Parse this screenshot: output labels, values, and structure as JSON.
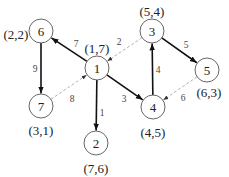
{
  "diagram": {
    "nodes": [
      {
        "id": "1",
        "label": "1",
        "coord": "(1,7)",
        "x": 97,
        "y": 68,
        "cx": 97,
        "cy": 48
      },
      {
        "id": "2",
        "label": "2",
        "coord": "(7,6)",
        "x": 96,
        "y": 143,
        "cx": 96,
        "cy": 168
      },
      {
        "id": "3",
        "label": "3",
        "coord": "(5,4)",
        "x": 152,
        "y": 31,
        "cx": 152,
        "cy": 11
      },
      {
        "id": "4",
        "label": "4",
        "coord": "(4,5)",
        "x": 153,
        "y": 107,
        "cx": 153,
        "cy": 132
      },
      {
        "id": "5",
        "label": "5",
        "coord": "(6,3)",
        "x": 207,
        "y": 70,
        "cx": 209,
        "cy": 92
      },
      {
        "id": "6",
        "label": "6",
        "coord": "(2,2)",
        "x": 41,
        "y": 31,
        "cx": 16,
        "cy": 34
      },
      {
        "id": "7",
        "label": "7",
        "coord": "(3,1)",
        "x": 41,
        "y": 106,
        "cx": 41,
        "cy": 130
      }
    ],
    "edges": [
      {
        "from": "1",
        "to": "6",
        "weight": "7",
        "style": "solid",
        "lx": 76,
        "ly": 44
      },
      {
        "from": "1",
        "to": "2",
        "weight": "1",
        "style": "solid",
        "lx": 102,
        "ly": 113
      },
      {
        "from": "1",
        "to": "4",
        "weight": "3",
        "style": "solid",
        "lx": 124,
        "ly": 99
      },
      {
        "from": "6",
        "to": "7",
        "weight": "9",
        "style": "solid",
        "lx": 35,
        "ly": 69
      },
      {
        "from": "4",
        "to": "3",
        "weight": "4",
        "style": "solid",
        "lx": 158,
        "ly": 70
      },
      {
        "from": "3",
        "to": "5",
        "weight": "5",
        "style": "solid",
        "lx": 186,
        "ly": 45
      },
      {
        "from": "3",
        "to": "1",
        "weight": "2",
        "style": "dashed",
        "lx": 119,
        "ly": 42
      },
      {
        "from": "7",
        "to": "1",
        "weight": "8",
        "style": "dashed",
        "lx": 72,
        "ly": 99
      },
      {
        "from": "5",
        "to": "4",
        "weight": "6",
        "style": "dashed",
        "lx": 183,
        "ly": 98
      }
    ]
  }
}
